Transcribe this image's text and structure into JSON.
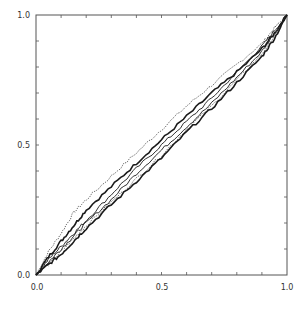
{
  "chart_data": {
    "type": "line",
    "title": "",
    "xlabel": "",
    "ylabel": "",
    "xlim": [
      0.0,
      1.0
    ],
    "ylim": [
      0.0,
      1.0
    ],
    "grid": false,
    "legend": null,
    "x_ticks": [
      "0.0",
      "0.5",
      "1.0"
    ],
    "y_ticks": [
      "0.0",
      "0.5",
      "1.0"
    ],
    "minor_tick_step": 0.1,
    "series": [
      {
        "name": "curve-1 (dotted, upper)",
        "style": "dotted",
        "x": [
          0,
          0.05,
          0.1,
          0.15,
          0.2,
          0.3,
          0.4,
          0.5,
          0.6,
          0.7,
          0.8,
          0.9,
          0.95,
          1.0
        ],
        "y": [
          0,
          0.09,
          0.16,
          0.24,
          0.29,
          0.38,
          0.47,
          0.56,
          0.65,
          0.73,
          0.81,
          0.89,
          0.95,
          1.0
        ]
      },
      {
        "name": "curve-2 (thick)",
        "style": "solid-thick",
        "x": [
          0,
          0.05,
          0.1,
          0.15,
          0.2,
          0.3,
          0.4,
          0.5,
          0.6,
          0.7,
          0.8,
          0.9,
          0.95,
          1.0
        ],
        "y": [
          0,
          0.07,
          0.13,
          0.19,
          0.25,
          0.34,
          0.43,
          0.52,
          0.61,
          0.7,
          0.78,
          0.87,
          0.93,
          1.0
        ]
      },
      {
        "name": "curve-3",
        "style": "solid",
        "x": [
          0,
          0.05,
          0.1,
          0.15,
          0.2,
          0.3,
          0.4,
          0.5,
          0.6,
          0.7,
          0.8,
          0.9,
          0.95,
          1.0
        ],
        "y": [
          0,
          0.06,
          0.11,
          0.16,
          0.21,
          0.31,
          0.41,
          0.5,
          0.59,
          0.68,
          0.78,
          0.88,
          0.94,
          1.0
        ]
      },
      {
        "name": "curve-4",
        "style": "solid",
        "x": [
          0,
          0.05,
          0.1,
          0.15,
          0.2,
          0.3,
          0.4,
          0.5,
          0.6,
          0.7,
          0.8,
          0.9,
          0.95,
          1.0
        ],
        "y": [
          0,
          0.05,
          0.1,
          0.15,
          0.2,
          0.29,
          0.39,
          0.48,
          0.57,
          0.66,
          0.76,
          0.86,
          0.93,
          1.0
        ]
      },
      {
        "name": "curve-5 (dotted, lower)",
        "style": "dotted",
        "x": [
          0,
          0.05,
          0.1,
          0.15,
          0.2,
          0.3,
          0.4,
          0.5,
          0.6,
          0.7,
          0.8,
          0.9,
          0.95,
          1.0
        ],
        "y": [
          0,
          0.04,
          0.09,
          0.14,
          0.19,
          0.28,
          0.37,
          0.46,
          0.56,
          0.65,
          0.75,
          0.85,
          0.92,
          1.0
        ]
      },
      {
        "name": "curve-6 (thick, lower)",
        "style": "solid-thick",
        "x": [
          0,
          0.05,
          0.1,
          0.15,
          0.2,
          0.3,
          0.4,
          0.5,
          0.6,
          0.7,
          0.8,
          0.9,
          0.95,
          1.0
        ],
        "y": [
          0,
          0.04,
          0.08,
          0.13,
          0.18,
          0.27,
          0.36,
          0.45,
          0.55,
          0.64,
          0.74,
          0.84,
          0.91,
          1.0
        ]
      }
    ]
  }
}
